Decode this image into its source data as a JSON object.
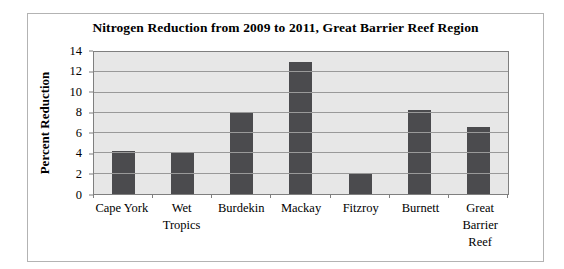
{
  "chart_data": {
    "type": "bar",
    "title": "Nitrogen Reduction from 2009 to 2011, Great Barrier Reef Region",
    "xlabel": "",
    "ylabel": "Percent Reduction",
    "categories": [
      "Cape York",
      "Wet Tropics",
      "Burdekin",
      "Mackay",
      "Fitzroy",
      "Burnett",
      "Great Barrier Reef"
    ],
    "values": [
      4.2,
      4.0,
      8.0,
      13.0,
      2.1,
      8.3,
      6.6
    ],
    "ylim": [
      0,
      14
    ],
    "yticks": [
      0,
      2,
      4,
      6,
      8,
      10,
      12,
      14
    ],
    "grid": true,
    "legend": "none",
    "colors": {
      "bar_color": "#4b4b4e",
      "plot_bg": "#e7e7e7",
      "gridline": "#999999",
      "axis": "#7f7f7f",
      "frame_border": "#b3b3b3",
      "background": "#ffffff",
      "text": "#000000"
    }
  }
}
